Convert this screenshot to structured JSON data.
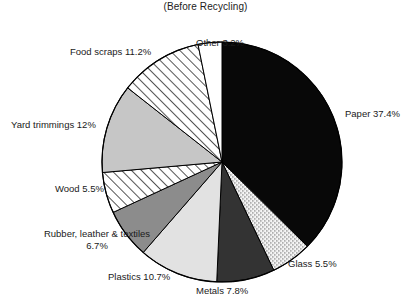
{
  "chart_data": {
    "type": "pie",
    "title": "(Before Recycling)",
    "xlabel": "",
    "ylabel": "",
    "legend_position": "none",
    "grid": false,
    "categories": [
      "Paper",
      "Glass",
      "Metals",
      "Plastics",
      "Rubber, leather & textiles",
      "Wood",
      "Yard trimmings",
      "Food scraps",
      "Other"
    ],
    "values": [
      37.4,
      5.5,
      7.8,
      10.7,
      6.7,
      5.5,
      12,
      11.2,
      3.2
    ],
    "units": "percent",
    "slices": [
      {
        "name": "Paper",
        "value": 37.4,
        "label": "Paper 37.4%",
        "fill": "#080808",
        "pattern": "solid",
        "start_deg": 0,
        "end_deg": 134.64,
        "label_x": 345,
        "label_y": 108,
        "label_align": "left"
      },
      {
        "name": "Glass",
        "value": 5.5,
        "label": "Glass 5.5%",
        "fill": "#ffffff",
        "pattern": "stipple",
        "start_deg": 134.64,
        "end_deg": 154.44,
        "label_x": 288,
        "label_y": 258,
        "label_align": "left"
      },
      {
        "name": "Metals",
        "value": 7.8,
        "label": "Metals 7.8%",
        "fill": "#333333",
        "pattern": "solid",
        "start_deg": 154.44,
        "end_deg": 182.52,
        "label_x": 196,
        "label_y": 285,
        "label_align": "left"
      },
      {
        "name": "Plastics",
        "value": 10.7,
        "label": "Plastics 10.7%",
        "fill": "#e2e2e2",
        "pattern": "solid",
        "start_deg": 182.52,
        "end_deg": 221.04,
        "label_x": 108,
        "label_y": 271,
        "label_align": "left"
      },
      {
        "name": "Rubber, leather & textiles",
        "value": 6.7,
        "label": "Rubber, leather & textiles",
        "label2": "6.7%",
        "fill": "#8c8c8c",
        "pattern": "solid",
        "start_deg": 221.04,
        "end_deg": 245.16,
        "label_x": 17,
        "label_y": 228,
        "label_align": "center"
      },
      {
        "name": "Wood",
        "value": 5.5,
        "label": "Wood 5.5%",
        "fill": "#ffffff",
        "pattern": "hatch",
        "start_deg": 245.16,
        "end_deg": 264.96,
        "label_x": 55,
        "label_y": 183,
        "label_align": "left"
      },
      {
        "name": "Yard trimmings",
        "value": 12,
        "label": "Yard trimmings 12%",
        "fill": "#c6c6c6",
        "pattern": "solid",
        "start_deg": 264.96,
        "end_deg": 308.16,
        "label_x": 11,
        "label_y": 119,
        "label_align": "left"
      },
      {
        "name": "Food scraps",
        "value": 11.2,
        "label": "Food scraps 11.2%",
        "fill": "#ffffff",
        "pattern": "hatch",
        "start_deg": 308.16,
        "end_deg": 348.48,
        "label_x": 70,
        "label_y": 46,
        "label_align": "left"
      },
      {
        "name": "Other",
        "value": 3.2,
        "label": "Other 3.2%",
        "fill": "#ffffff",
        "pattern": "solid",
        "start_deg": 348.48,
        "end_deg": 360,
        "label_x": 196,
        "label_y": 37,
        "label_align": "left"
      }
    ],
    "geometry": {
      "center_x": 222,
      "center_y": 162,
      "radius": 120,
      "stroke": "#000000",
      "stroke_width": 1
    }
  }
}
